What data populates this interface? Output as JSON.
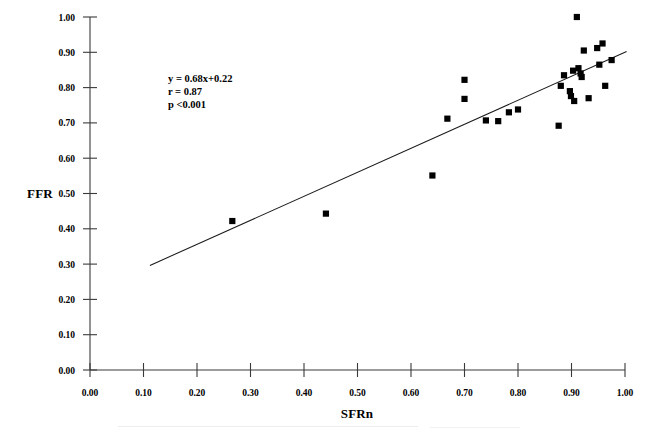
{
  "chart_data": {
    "type": "scatter",
    "title": "",
    "xlabel": "SFRn",
    "ylabel": "FFR",
    "xlim": [
      0.0,
      1.0
    ],
    "ylim": [
      0.0,
      1.0
    ],
    "grid": false,
    "legend": "none",
    "xticks": [
      "0.00",
      "0.10",
      "0.20",
      "0.30",
      "0.40",
      "0.50",
      "0.60",
      "0.70",
      "0.80",
      "0.90",
      "1.00"
    ],
    "xtick_values": [
      0.0,
      0.1,
      0.2,
      0.3,
      0.4,
      0.5,
      0.6,
      0.7,
      0.8,
      0.9,
      1.0
    ],
    "yticks": [
      "0.00",
      "0.10",
      "0.20",
      "0.30",
      "0.40",
      "0.50",
      "0.60",
      "0.70",
      "0.80",
      "0.90",
      "1.00"
    ],
    "ytick_values": [
      0.0,
      0.1,
      0.2,
      0.3,
      0.4,
      0.5,
      0.6,
      0.7,
      0.8,
      0.9,
      1.0
    ],
    "marker": "square",
    "marker_color": "#000000",
    "points": [
      {
        "x": 0.266,
        "y": 0.422
      },
      {
        "x": 0.441,
        "y": 0.443
      },
      {
        "x": 0.64,
        "y": 0.551
      },
      {
        "x": 0.668,
        "y": 0.712
      },
      {
        "x": 0.7,
        "y": 0.822
      },
      {
        "x": 0.7,
        "y": 0.768
      },
      {
        "x": 0.74,
        "y": 0.707
      },
      {
        "x": 0.763,
        "y": 0.705
      },
      {
        "x": 0.783,
        "y": 0.73
      },
      {
        "x": 0.8,
        "y": 0.738
      },
      {
        "x": 0.876,
        "y": 0.692
      },
      {
        "x": 0.88,
        "y": 0.805
      },
      {
        "x": 0.886,
        "y": 0.835
      },
      {
        "x": 0.897,
        "y": 0.79
      },
      {
        "x": 0.899,
        "y": 0.776
      },
      {
        "x": 0.903,
        "y": 0.848
      },
      {
        "x": 0.905,
        "y": 0.762
      },
      {
        "x": 0.91,
        "y": 1.0
      },
      {
        "x": 0.913,
        "y": 0.855
      },
      {
        "x": 0.917,
        "y": 0.84
      },
      {
        "x": 0.919,
        "y": 0.83
      },
      {
        "x": 0.923,
        "y": 0.905
      },
      {
        "x": 0.932,
        "y": 0.77
      },
      {
        "x": 0.948,
        "y": 0.912
      },
      {
        "x": 0.952,
        "y": 0.865
      },
      {
        "x": 0.958,
        "y": 0.925
      },
      {
        "x": 0.963,
        "y": 0.805
      },
      {
        "x": 0.975,
        "y": 0.878
      }
    ],
    "fit_line": {
      "equation": "y = 0.68x+0.22",
      "slope": 0.68,
      "intercept": 0.22,
      "x_start": 0.112,
      "x_end": 1.003
    },
    "annotations": {
      "equation": "y = 0.68x+0.22",
      "correlation": "r = 0.87",
      "pvalue": "p <0.001"
    },
    "statistics": {
      "r": 0.87,
      "p": "<0.001",
      "n": 28
    }
  }
}
